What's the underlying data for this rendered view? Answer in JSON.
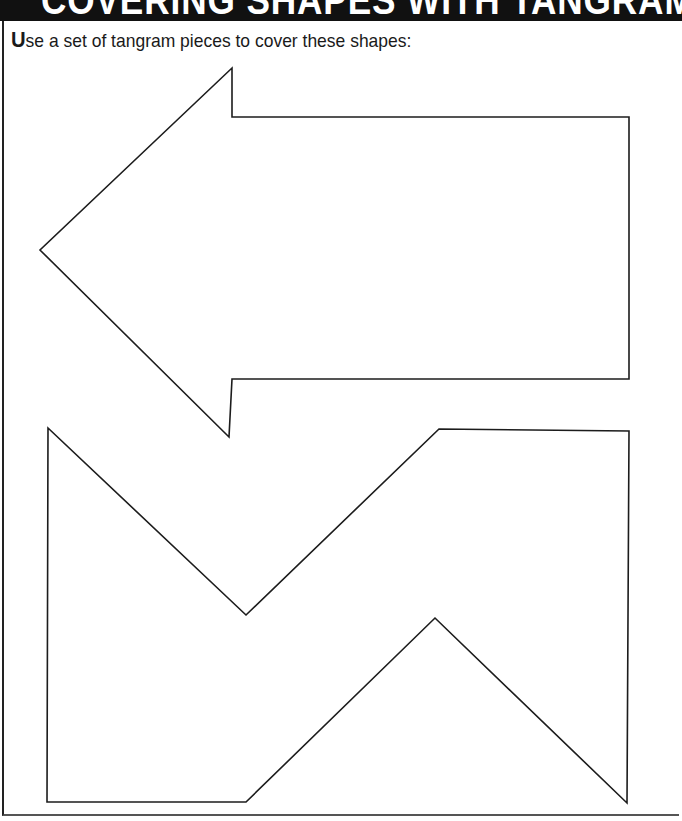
{
  "header": {
    "title": "COVERING SHAPES WITH TANGRAMS"
  },
  "instruction": {
    "lead_letter": "U",
    "rest": "se a set of tangram pieces to cover these shapes:"
  },
  "shapes": [
    {
      "name": "arrow-shape",
      "description": "Left-pointing arrow outline"
    },
    {
      "name": "zigzag-shape",
      "description": "Zigzag M-like outline"
    }
  ],
  "colors": {
    "header_bg": "#111111",
    "header_text": "#ffffff",
    "outline": "#1c1c1c"
  }
}
